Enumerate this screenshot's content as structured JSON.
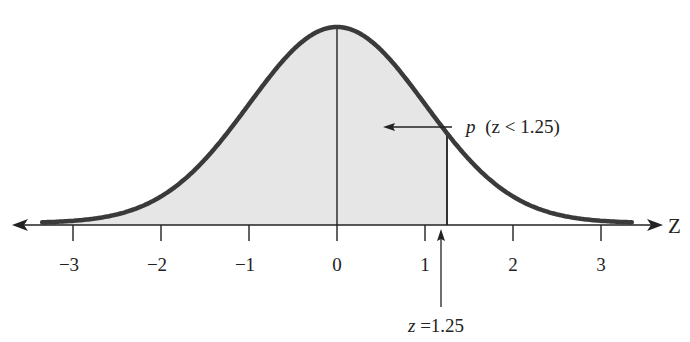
{
  "chart_data": {
    "type": "area",
    "title": "",
    "subtitle": "",
    "xlabel": "Z",
    "ylabel": "",
    "distribution": "standard normal",
    "mean": 0,
    "sd": 1,
    "xlim": [
      -3.35,
      3.35
    ],
    "x_ticks": [
      -3,
      -2,
      -1,
      0,
      1,
      2,
      3
    ],
    "x_tick_labels": [
      "−3",
      "−2",
      "−1",
      "0",
      "1",
      "2",
      "3"
    ],
    "shaded_region": {
      "from": "-inf",
      "to": 1.25,
      "label": "p (z < 1.25)"
    },
    "annotations": [
      {
        "text": "p (z < 1.25)",
        "points_to": "shaded area"
      },
      {
        "text": "z =1.25",
        "points_to": "x = 1.25 on axis"
      }
    ],
    "mean_line": 0,
    "grid": false,
    "legend": "none",
    "colors": {
      "curve": "#3a3a3a",
      "fill": "#e6e6e6",
      "axis": "#222222"
    }
  },
  "labels": {
    "axis_name": "Z",
    "ticks": [
      "−3",
      "−2",
      "−1",
      "0",
      "1",
      "2",
      "3"
    ],
    "area_label_p": "p",
    "area_label_rest": "(z < 1.25)",
    "z_marker_var": "z",
    "z_marker_value": " =1.25"
  }
}
